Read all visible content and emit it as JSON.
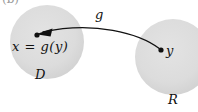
{
  "figure": {
    "tag": "(b)",
    "width": 198,
    "height": 112,
    "background_color": "#ffffff",
    "ink_color": "#111111",
    "region_fill_color": "#dcdcdc"
  },
  "regions": [
    {
      "name": "domain",
      "label": "D",
      "cx": 47,
      "cy": 42,
      "r": 37,
      "fill": "#dcdcdc"
    },
    {
      "name": "range",
      "label": "R",
      "cx": 173,
      "cy": 57,
      "r": 38,
      "fill": "#dcdcdc"
    }
  ],
  "points": [
    {
      "name": "image-point",
      "label": "x  =  g(y)",
      "x": 37,
      "y": 35
    },
    {
      "name": "source-point",
      "label": "y",
      "x": 161,
      "y": 50
    }
  ],
  "arrow": {
    "name": "mapping-arrow",
    "label": "g",
    "from": "y",
    "to": "x = g(y)",
    "direction": "right-to-left",
    "path": "M 161 50 C 140 34, 95 22, 42 33"
  }
}
